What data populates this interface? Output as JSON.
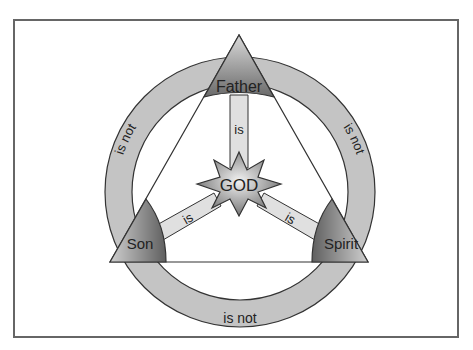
{
  "diagram": {
    "center": {
      "label": "GOD"
    },
    "persons": [
      {
        "id": "father",
        "label": "Father"
      },
      {
        "id": "son",
        "label": "Son"
      },
      {
        "id": "spirit",
        "label": "Spirit"
      }
    ],
    "relations": {
      "is_label": "is",
      "is_not_label": "is not"
    },
    "colors": {
      "ring": "#c4c4c4",
      "stroke": "#333333",
      "person_dark": "#6f6f6f",
      "person_light": "#cfcfcf",
      "spoke": "#e0e0e0",
      "frame": "#666666"
    }
  }
}
